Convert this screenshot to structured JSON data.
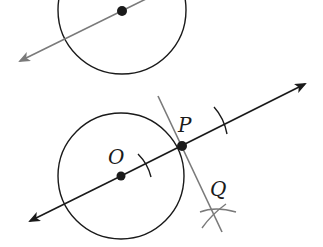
{
  "figure": {
    "width": 323,
    "height": 247,
    "colors": {
      "background": "#ffffff",
      "ink": "#1a1a1a",
      "gray_line": "#7a7a7a"
    },
    "top_figure": {
      "circle": {
        "cx": 122,
        "cy": 10,
        "r": 64
      },
      "center_point": {
        "x": 122,
        "y": 11
      },
      "line": {
        "x1": 20,
        "y1": 61,
        "x2": 150,
        "y2": -4
      }
    },
    "bottom_figure": {
      "circle": {
        "cx": 121,
        "cy": 176,
        "r": 63
      },
      "center": {
        "x": 121,
        "y": 176,
        "label": "O"
      },
      "tangent_point": {
        "x": 182,
        "y": 146,
        "label": "P"
      },
      "construction_point": {
        "label": "Q"
      },
      "line_OP": {
        "x1": 30,
        "y1": 220,
        "x2": 305,
        "y2": 84
      },
      "perpendicular": {
        "x1": 158,
        "y1": 96,
        "x2": 222,
        "y2": 232
      }
    },
    "labels": {
      "O": "O",
      "P": "P",
      "Q": "Q"
    }
  }
}
